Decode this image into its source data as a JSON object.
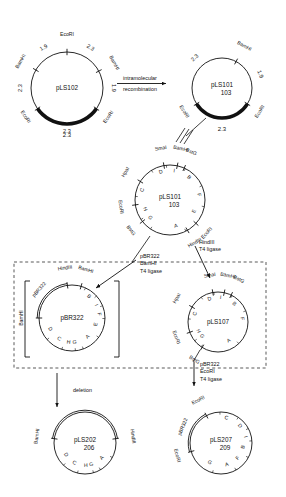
{
  "figure": {
    "background": "#ffffff",
    "ink": "#111111"
  },
  "plasmids": [
    {
      "id": "pLS102",
      "name": "pLS102",
      "subname": "",
      "cx": 67,
      "cy": 88,
      "r": 36,
      "sites": [
        {
          "label": "EcoRI",
          "angle": 90
        },
        {
          "label": "BamHI",
          "angle": 150
        },
        {
          "label": "EcoRI",
          "angle": 215
        },
        {
          "label": "EcoRI",
          "angle": 325
        },
        {
          "label": "BamHI",
          "angle": 28
        }
      ],
      "arcs": [
        {
          "value": "1.9",
          "angle": 120
        },
        {
          "value": "2.3",
          "angle": 60
        },
        {
          "value": "2.3",
          "angle": 180
        },
        {
          "value": "1.9",
          "angle": 0
        },
        {
          "value": "2.3",
          "angle": 270
        }
      ],
      "thick_arc": {
        "from": 215,
        "to": 325,
        "label": "2.3"
      }
    },
    {
      "id": "pLS101-103",
      "name": "pLS101",
      "subname": "103",
      "cx": 222,
      "cy": 88,
      "r": 30,
      "sites": [
        {
          "label": "BamHI",
          "angle": 62
        },
        {
          "label": "EcoRI",
          "angle": 212
        },
        {
          "label": "EcoRI",
          "angle": 328
        }
      ],
      "arcs": [
        {
          "value": "2.3",
          "angle": 132
        },
        {
          "value": "1.9",
          "angle": 20
        }
      ],
      "thick_arc": {
        "from": 212,
        "to": 328,
        "label": "2.3"
      }
    },
    {
      "id": "pLS101-103-map",
      "name": "pLS101",
      "subname": "103",
      "cx": 170,
      "cy": 200,
      "r": 35,
      "sites": [
        {
          "label": "SmaI",
          "angle": 100
        },
        {
          "label": "BamHI",
          "angle": 78
        },
        {
          "label": "BstG",
          "angle": 66
        },
        {
          "label": "HpaI",
          "angle": 148
        },
        {
          "label": "EcoRI",
          "angle": 188
        },
        {
          "label": "BstG",
          "angle": 218
        },
        {
          "label": "EcoRI",
          "angle": 318
        },
        {
          "label": "HindIII",
          "angle": 300
        }
      ],
      "segments": [
        {
          "letter": "D",
          "angle": 108
        },
        {
          "letter": "I",
          "angle": 82
        },
        {
          "letter": "B",
          "angle": 50
        },
        {
          "letter": "F",
          "angle": 10
        },
        {
          "letter": "E",
          "angle": 335
        },
        {
          "letter": "A",
          "angle": 283
        },
        {
          "letter": "G",
          "angle": 222
        },
        {
          "letter": "H",
          "angle": 200
        },
        {
          "letter": "C",
          "angle": 160
        }
      ]
    },
    {
      "id": "pBR322-insert",
      "name": "pBR322",
      "subname": "",
      "cx": 72,
      "cy": 318,
      "r": 33,
      "sites": [
        {
          "label": "HindIII",
          "angle": 98
        },
        {
          "label": "BamHI",
          "angle": 74
        },
        {
          "label": "BamHI",
          "angle": 180
        }
      ],
      "segments": [
        {
          "letter": "B",
          "angle": 52
        },
        {
          "letter": "I",
          "angle": 28
        },
        {
          "letter": "F",
          "angle": 8
        },
        {
          "letter": "E",
          "angle": 345
        },
        {
          "letter": "A",
          "angle": 310
        },
        {
          "letter": "G",
          "angle": 276
        },
        {
          "letter": "H",
          "angle": 262
        },
        {
          "letter": "C",
          "angle": 238
        },
        {
          "letter": "D",
          "angle": 207
        }
      ],
      "backbone_label": "pBR322",
      "backbone_from": 98,
      "backbone_to": 180,
      "bracketed": true
    },
    {
      "id": "pLS107",
      "name": "pLS107",
      "subname": "",
      "cx": 218,
      "cy": 322,
      "r": 30,
      "sites": [
        {
          "label": "SmaI",
          "angle": 100
        },
        {
          "label": "BamHI",
          "angle": 78
        },
        {
          "label": "BstG",
          "angle": 64
        },
        {
          "label": "HpaI",
          "angle": 150
        },
        {
          "label": "EcoRI",
          "angle": 200
        },
        {
          "label": "BstG",
          "angle": 238
        }
      ],
      "segments": [
        {
          "letter": "D",
          "angle": 110
        },
        {
          "letter": "I",
          "angle": 84
        },
        {
          "letter": "B",
          "angle": 48
        },
        {
          "letter": "F",
          "angle": 8
        },
        {
          "letter": "A",
          "angle": 300
        },
        {
          "letter": "G",
          "angle": 222
        },
        {
          "letter": "H",
          "angle": 205
        },
        {
          "letter": "C",
          "angle": 160
        }
      ]
    },
    {
      "id": "pLS202-206",
      "name": "pLS202",
      "subname": "206",
      "cx": 85,
      "cy": 443,
      "r": 31,
      "sites": [
        {
          "label": "BamHI",
          "angle": 172
        },
        {
          "label": "HindIII",
          "angle": 8
        }
      ],
      "segments": [
        {
          "letter": "D",
          "angle": 212
        },
        {
          "letter": "C",
          "angle": 242
        },
        {
          "letter": "H",
          "angle": 272
        },
        {
          "letter": "G",
          "angle": 286
        },
        {
          "letter": "A",
          "angle": 318
        }
      ],
      "double_top": true
    },
    {
      "id": "pLS207-209",
      "name": "pLS207",
      "subname": "209",
      "cx": 221,
      "cy": 443,
      "r": 31,
      "sites": [
        {
          "label": "EcoRI",
          "angle": 118
        },
        {
          "label": "EcoRI",
          "angle": 196
        }
      ],
      "segments": [
        {
          "letter": "C",
          "angle": 78
        },
        {
          "letter": "D",
          "angle": 42
        },
        {
          "letter": "I",
          "angle": 14
        },
        {
          "letter": "B",
          "angle": 350
        },
        {
          "letter": "F",
          "angle": 318
        },
        {
          "letter": "A",
          "angle": 285
        },
        {
          "letter": "G",
          "angle": 240
        }
      ],
      "backbone_label": "pBR322",
      "backbone_from": 118,
      "backbone_to": 196
    }
  ],
  "steps": [
    {
      "id": "intramolecular-recombination",
      "line1": "intramolecular",
      "line2": "recombination",
      "x": 118,
      "y": 80
    },
    {
      "id": "pbr322-bamhi-ligation",
      "lines": [
        "pBR322",
        "BamHI",
        "T4 ligase"
      ],
      "x": 118,
      "y": 258
    },
    {
      "id": "hindiii-ligation",
      "lines": [
        "HindIII",
        "T4 ligase"
      ],
      "x": 193,
      "y": 244
    },
    {
      "id": "deletion",
      "lines": [
        "deletion"
      ],
      "x": 57,
      "y": 383
    },
    {
      "id": "pbr322-ecori-ligation",
      "lines": [
        "pBR322",
        "EcoRI",
        "T4 ligase"
      ],
      "x": 222,
      "y": 370
    }
  ],
  "equivalence_symbol": "‖"
}
